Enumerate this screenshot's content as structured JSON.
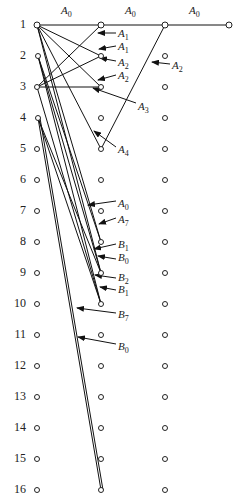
{
  "diagram": {
    "type": "network-graph",
    "columns_x": [
      37,
      101,
      165,
      229
    ],
    "rows": [
      {
        "label": "1",
        "y": 25
      },
      {
        "label": "2",
        "y": 56
      },
      {
        "label": "3",
        "y": 87
      },
      {
        "label": "4",
        "y": 118
      },
      {
        "label": "5",
        "y": 149
      },
      {
        "label": "6",
        "y": 180
      },
      {
        "label": "7",
        "y": 211
      },
      {
        "label": "8",
        "y": 242
      },
      {
        "label": "9",
        "y": 273
      },
      {
        "label": "10",
        "y": 304
      },
      {
        "label": "11",
        "y": 335
      },
      {
        "label": "12",
        "y": 366
      },
      {
        "label": "13",
        "y": 397
      },
      {
        "label": "14",
        "y": 428
      },
      {
        "label": "15",
        "y": 459
      },
      {
        "label": "16",
        "y": 490
      }
    ],
    "extra_nodes": [
      {
        "col": 3,
        "row": 0
      }
    ],
    "edges": [
      {
        "from": [
          37,
          25
        ],
        "to": [
          101,
          25
        ]
      },
      {
        "from": [
          101,
          25
        ],
        "to": [
          165,
          25
        ]
      },
      {
        "from": [
          165,
          25
        ],
        "to": [
          229,
          25
        ]
      },
      {
        "from": [
          37,
          25
        ],
        "to": [
          101,
          56
        ]
      },
      {
        "from": [
          37,
          25
        ],
        "to": [
          101,
          87
        ]
      },
      {
        "from": [
          37,
          25
        ],
        "to": [
          101,
          149
        ]
      },
      {
        "from": [
          37,
          25
        ],
        "to": [
          101,
          242
        ]
      },
      {
        "from": [
          37,
          25
        ],
        "to": [
          101,
          273
        ]
      },
      {
        "from": [
          37,
          87
        ],
        "to": [
          101,
          25
        ]
      },
      {
        "from": [
          37,
          87
        ],
        "to": [
          101,
          56
        ]
      },
      {
        "from": [
          37,
          87
        ],
        "to": [
          101,
          87
        ]
      },
      {
        "from": [
          37,
          87
        ],
        "to": [
          101,
          304
        ]
      },
      {
        "from": [
          165,
          25
        ],
        "to": [
          101,
          149
        ]
      },
      {
        "from": [
          38,
          56
        ],
        "to": [
          101,
          242
        ]
      },
      {
        "from": [
          38,
          56
        ],
        "to": [
          101,
          273
        ]
      },
      {
        "from": [
          38,
          56
        ],
        "to": [
          101,
          304
        ]
      },
      {
        "from": [
          38,
          118
        ],
        "to": [
          101,
          273
        ]
      },
      {
        "from": [
          38,
          118
        ],
        "to": [
          101,
          304
        ]
      },
      {
        "from": [
          38,
          118
        ],
        "to": [
          101,
          490
        ]
      },
      {
        "from": [
          40,
          118
        ],
        "to": [
          103,
          490
        ]
      }
    ],
    "top_labels": [
      {
        "base": "A",
        "sub": "0",
        "x": 61,
        "y": 4
      },
      {
        "base": "A",
        "sub": "0",
        "x": 125,
        "y": 4
      },
      {
        "base": "A",
        "sub": "0",
        "x": 189,
        "y": 4
      }
    ],
    "edge_labels": [
      {
        "base": "A",
        "sub": "1",
        "x": 118,
        "y": 27,
        "ax": [
          116,
          33
        ],
        "tip": [
          98,
          33
        ]
      },
      {
        "base": "A",
        "sub": "1",
        "x": 118,
        "y": 40,
        "ax": [
          116,
          46
        ],
        "tip": [
          99,
          49
        ]
      },
      {
        "base": "A",
        "sub": "2",
        "x": 118,
        "y": 56,
        "ax": [
          116,
          61
        ],
        "tip": [
          100,
          58
        ]
      },
      {
        "base": "A",
        "sub": "2",
        "x": 118,
        "y": 69,
        "ax": [
          116,
          75
        ],
        "tip": [
          98,
          80
        ]
      },
      {
        "base": "A",
        "sub": "2",
        "x": 172,
        "y": 59,
        "ax": [
          170,
          64
        ],
        "tip": [
          152,
          62
        ]
      },
      {
        "base": "A",
        "sub": "3",
        "x": 138,
        "y": 100,
        "ax": [
          136,
          103
        ],
        "tip": [
          93,
          88
        ]
      },
      {
        "base": "A",
        "sub": "4",
        "x": 118,
        "y": 143,
        "ax": [
          116,
          147
        ],
        "tip": [
          94,
          131
        ]
      },
      {
        "base": "A",
        "sub": "0",
        "x": 118,
        "y": 197,
        "ax": [
          116,
          201
        ],
        "tip": [
          88,
          205
        ]
      },
      {
        "base": "A",
        "sub": "7",
        "x": 118,
        "y": 213,
        "ax": [
          116,
          218
        ],
        "tip": [
          99,
          224
        ]
      },
      {
        "base": "B",
        "sub": "1",
        "x": 118,
        "y": 238,
        "ax": [
          116,
          244
        ],
        "tip": [
          94,
          249
        ]
      },
      {
        "base": "B",
        "sub": "0",
        "x": 118,
        "y": 251,
        "ax": [
          116,
          259
        ],
        "tip": [
          98,
          256
        ]
      },
      {
        "base": "B",
        "sub": "2",
        "x": 118,
        "y": 271,
        "ax": [
          116,
          278
        ],
        "tip": [
          95,
          275
        ]
      },
      {
        "base": "B",
        "sub": "1",
        "x": 118,
        "y": 283,
        "ax": [
          116,
          290
        ],
        "tip": [
          100,
          287
        ]
      },
      {
        "base": "B",
        "sub": "7",
        "x": 118,
        "y": 308,
        "ax": [
          116,
          313
        ],
        "tip": [
          77,
          308
        ]
      },
      {
        "base": "B",
        "sub": "0",
        "x": 118,
        "y": 340,
        "ax": [
          116,
          344
        ],
        "tip": [
          78,
          337
        ]
      }
    ]
  }
}
